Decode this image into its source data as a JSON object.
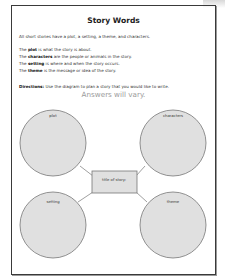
{
  "worksheet": {
    "title": "Story Words",
    "intro": "All short stories have a plot, a setting, a theme, and characters.",
    "definitions": [
      {
        "term": "plot",
        "prefix": "The ",
        "rest": " is what the story is about."
      },
      {
        "term": "characters",
        "prefix": "The ",
        "rest": " are the people or animals in the story."
      },
      {
        "term": "setting",
        "prefix": "The ",
        "rest": " is where and when the story occurs."
      },
      {
        "term": "theme",
        "prefix": "The ",
        "rest": " is the message or idea of the story."
      }
    ],
    "directions_label": "Directions:",
    "directions_text": " Use the diagram to plan a story that you would like to write.",
    "answer_note": "Answers will vary."
  },
  "diagram": {
    "center_box_label": "title of story:",
    "circles": [
      {
        "id": "plot",
        "label": "plot"
      },
      {
        "id": "characters",
        "label": "characters"
      },
      {
        "id": "setting",
        "label": "setting"
      },
      {
        "id": "theme",
        "label": "theme"
      }
    ],
    "colors": {
      "circle_fill": "#e0e0e0",
      "stroke": "#777777",
      "border": "#3a3a3a",
      "answer_note": "#9a9a9a"
    }
  }
}
